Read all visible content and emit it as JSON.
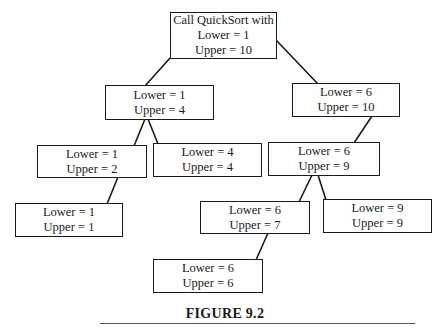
{
  "diagram": {
    "type": "recursion-tree",
    "caption": "FIGURE 9.2",
    "nodes": {
      "root": {
        "line1": "Call QuickSort with",
        "line2": "Lower = 1",
        "line3": "Upper = 10"
      },
      "n1_4": {
        "line1": "Lower = 1",
        "line2": "Upper = 4"
      },
      "n6_10": {
        "line1": "Lower = 6",
        "line2": "Upper = 10"
      },
      "n1_2": {
        "line1": "Lower = 1",
        "line2": "Upper = 2"
      },
      "n4_4": {
        "line1": "Lower = 4",
        "line2": "Upper = 4"
      },
      "n6_9": {
        "line1": "Lower = 6",
        "line2": "Upper = 9"
      },
      "n1_1": {
        "line1": "Lower = 1",
        "line2": "Upper = 1"
      },
      "n6_7": {
        "line1": "Lower = 6",
        "line2": "Upper = 7"
      },
      "n9_9": {
        "line1": "Lower = 9",
        "line2": "Upper = 9"
      },
      "n6_6": {
        "line1": "Lower = 6",
        "line2": "Upper = 6"
      }
    },
    "edges": [
      [
        "root",
        "n1_4"
      ],
      [
        "root",
        "n6_10"
      ],
      [
        "n1_4",
        "n1_2"
      ],
      [
        "n1_4",
        "n4_4"
      ],
      [
        "n6_10",
        "n6_9"
      ],
      [
        "n1_2",
        "n1_1"
      ],
      [
        "n6_9",
        "n6_7"
      ],
      [
        "n6_9",
        "n9_9"
      ],
      [
        "n6_7",
        "n6_6"
      ]
    ]
  }
}
